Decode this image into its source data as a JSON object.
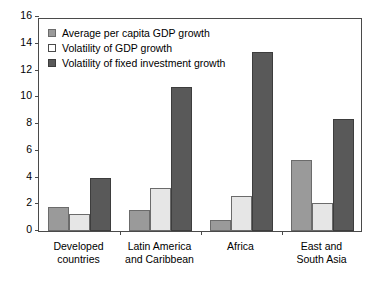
{
  "chart_data": {
    "type": "bar",
    "title": "",
    "subtitle": "",
    "xlabel": "",
    "ylabel": "",
    "ylim": [
      0,
      16
    ],
    "ytick_step": 2,
    "yticks": [
      "16",
      "14",
      "12",
      "10",
      "8",
      "6",
      "4",
      "2",
      "0"
    ],
    "grid": false,
    "legend_position": "top-left",
    "categories": [
      "Developed countries",
      "Latin America and Caribbean",
      "Africa",
      "East and South Asia"
    ],
    "category_lines": [
      [
        "Developed",
        "countries"
      ],
      [
        "Latin America",
        "and Caribbean"
      ],
      [
        "Africa",
        ""
      ],
      [
        "East and",
        "South Asia"
      ]
    ],
    "series": [
      {
        "name": "Average per capita GDP growth",
        "color": "#9a9a9a",
        "values": [
          1.8,
          1.6,
          0.85,
          5.3
        ]
      },
      {
        "name": "Volatility of GDP growth",
        "color": "#e6e6e6",
        "values": [
          1.3,
          3.2,
          2.6,
          2.1
        ]
      },
      {
        "name": "Volatility of fixed investment growth",
        "color": "#595959",
        "values": [
          3.95,
          10.75,
          13.4,
          8.4
        ]
      }
    ]
  }
}
